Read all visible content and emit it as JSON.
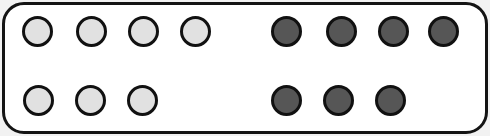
{
  "scene": {
    "name": "token-rows-panel",
    "width": 490,
    "height": 136,
    "background_color": "#f2f2f2"
  },
  "card": {
    "name": "rounded-card",
    "fill_color": "#ffffff",
    "border_color": "#141414",
    "border_width": 3,
    "corner_radius": 22,
    "x": 2,
    "y": 2,
    "width": 486,
    "height": 132
  },
  "tokens": {
    "shape": "circle",
    "diameter": 31,
    "outline_color": "#111111",
    "outline_width": 3,
    "light_fill": "#e1e1e1",
    "dark_fill": "#565656",
    "groups": [
      {
        "name": "row-1-light-group",
        "row": 1,
        "variant": "light",
        "count": 4,
        "items": [
          {
            "label": "row1-light-1",
            "cx": 37,
            "cy": 31
          },
          {
            "label": "row1-light-2",
            "cx": 91,
            "cy": 31
          },
          {
            "label": "row1-light-3",
            "cx": 143,
            "cy": 31
          },
          {
            "label": "row1-light-4",
            "cx": 195,
            "cy": 31
          }
        ]
      },
      {
        "name": "row-1-dark-group",
        "row": 1,
        "variant": "dark",
        "count": 4,
        "items": [
          {
            "label": "row1-dark-1",
            "cx": 286,
            "cy": 31
          },
          {
            "label": "row1-dark-2",
            "cx": 341,
            "cy": 31
          },
          {
            "label": "row1-dark-3",
            "cx": 393,
            "cy": 31
          },
          {
            "label": "row1-dark-4",
            "cx": 443,
            "cy": 31
          }
        ]
      },
      {
        "name": "row-2-light-group",
        "row": 2,
        "variant": "light",
        "count": 3,
        "items": [
          {
            "label": "row2-light-1",
            "cx": 38,
            "cy": 100
          },
          {
            "label": "row2-light-2",
            "cx": 90,
            "cy": 100
          },
          {
            "label": "row2-light-3",
            "cx": 142,
            "cy": 100
          }
        ]
      },
      {
        "name": "row-2-dark-group",
        "row": 2,
        "variant": "dark",
        "count": 3,
        "items": [
          {
            "label": "row2-dark-1",
            "cx": 286,
            "cy": 100
          },
          {
            "label": "row2-dark-2",
            "cx": 338,
            "cy": 100
          },
          {
            "label": "row2-dark-3",
            "cx": 390,
            "cy": 100
          }
        ]
      }
    ]
  }
}
